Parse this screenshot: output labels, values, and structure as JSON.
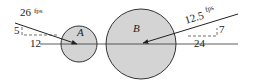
{
  "diagram": {
    "title": "",
    "colors": {
      "circle_fill": "#d4d4d4",
      "stroke": "#333333",
      "background": "#ffffff"
    },
    "line_of_impact": {
      "y": 44,
      "x1": 40,
      "x2": 238
    },
    "ball_a": {
      "label": "A",
      "center": [
        79,
        44
      ],
      "radius": 18,
      "velocity": {
        "magnitude": "26",
        "unit": "fps",
        "slope_rise": "5",
        "slope_run": "12",
        "arrow_start": [
          15,
          23
        ],
        "arrow_end": [
          77,
          44
        ]
      }
    },
    "ball_b": {
      "label": "B",
      "center": [
        141,
        44
      ],
      "radius": 35,
      "velocity": {
        "magnitude": "12.5",
        "unit": "fps",
        "slope_rise": "7",
        "slope_run": "24",
        "arrow_start": [
          238,
          14
        ],
        "arrow_end": [
          143,
          43
        ]
      }
    }
  }
}
